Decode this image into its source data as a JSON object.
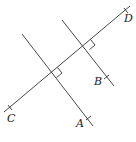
{
  "diagram": {
    "stroke_color": "#333333",
    "points": {
      "C": {
        "label": "C"
      },
      "D": {
        "label": "D"
      },
      "A": {
        "label": "A"
      },
      "B": {
        "label": "B"
      }
    },
    "right_angle_marks": 2
  }
}
